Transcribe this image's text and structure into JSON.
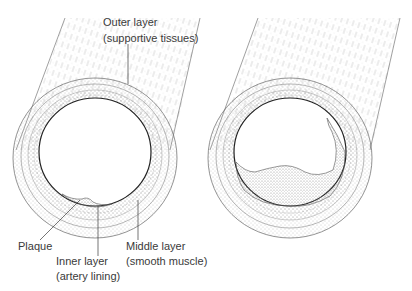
{
  "figure": {
    "panels": [
      {
        "id": "healthy",
        "description": "Artery cross-section with small plaque deposit"
      },
      {
        "id": "narrowed",
        "description": "Artery cross-section with large plaque narrowing the lumen"
      }
    ],
    "labels": {
      "outer_layer": "Outer layer",
      "outer_layer_sub": "(supportive tissues)",
      "plaque": "Plaque",
      "inner_layer": "Inner layer",
      "inner_layer_sub": "(artery lining)",
      "middle_layer": "Middle layer",
      "middle_layer_sub": "(smooth muscle)"
    },
    "colors": {
      "line": "#3a3a3a",
      "stipple": "#9a9a9a",
      "background": "#ffffff"
    }
  }
}
